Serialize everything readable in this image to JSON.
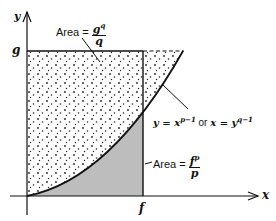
{
  "diagram": {
    "axes": {
      "x_label": "x",
      "y_label": "y"
    },
    "ticks": {
      "x_tick": "f",
      "y_tick": "g"
    },
    "curve_label": {
      "left": "y = x",
      "left_exp": "p−1",
      "mid": " or ",
      "right": "x = y",
      "right_exp": "q−1"
    },
    "upper_area": {
      "prefix": "Area = ",
      "num_base": "g",
      "num_exp": "q",
      "den": "q"
    },
    "lower_area": {
      "prefix": "Area = ",
      "num_base": "f",
      "num_exp": "p",
      "den": "p"
    },
    "colors": {
      "line": "#111111",
      "lower_fill": "#bdbdbd",
      "dots": "#222222",
      "background": "#ffffff"
    }
  }
}
